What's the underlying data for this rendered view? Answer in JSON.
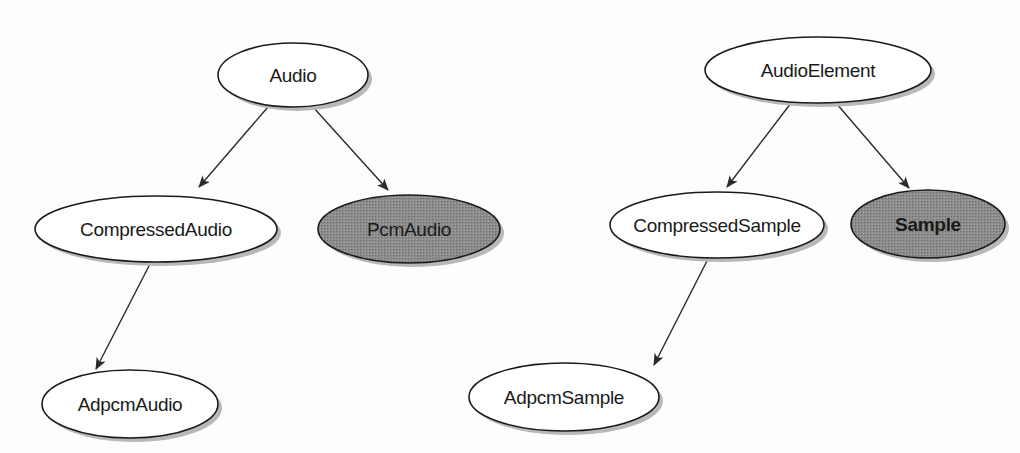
{
  "diagrams": [
    {
      "name": "audio-hierarchy",
      "nodes": [
        {
          "id": "Audio",
          "label": "Audio",
          "filled": false
        },
        {
          "id": "CompressedAudio",
          "label": "CompressedAudio",
          "filled": false
        },
        {
          "id": "PcmAudio",
          "label": "PcmAudio",
          "filled": true
        },
        {
          "id": "AdpcmAudio",
          "label": "AdpcmAudio",
          "filled": false
        }
      ],
      "edges": [
        {
          "from": "Audio",
          "to": "CompressedAudio"
        },
        {
          "from": "Audio",
          "to": "PcmAudio"
        },
        {
          "from": "CompressedAudio",
          "to": "AdpcmAudio"
        }
      ]
    },
    {
      "name": "audio-element-hierarchy",
      "nodes": [
        {
          "id": "AudioElement",
          "label": "AudioElement",
          "filled": false
        },
        {
          "id": "CompressedSample",
          "label": "CompressedSample",
          "filled": false
        },
        {
          "id": "Sample",
          "label": "Sample",
          "filled": true
        },
        {
          "id": "AdpcmSample",
          "label": "AdpcmSample",
          "filled": false
        }
      ],
      "edges": [
        {
          "from": "AudioElement",
          "to": "CompressedSample"
        },
        {
          "from": "AudioElement",
          "to": "Sample"
        },
        {
          "from": "CompressedSample",
          "to": "AdpcmSample"
        }
      ]
    }
  ],
  "colors": {
    "filled_node": "#8a8a8a",
    "empty_node": "#ffffff",
    "stroke": "#1a1a1a",
    "shadow": "#b0b0b0"
  }
}
